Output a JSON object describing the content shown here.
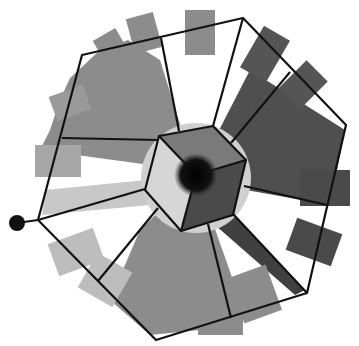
{
  "diagram": {
    "colors": {
      "background": "#ffffff",
      "edge": "#111111",
      "fan_light": "#bdbdbd",
      "fan_mid": "#8c8c8c",
      "fan_dark": "#555555",
      "fan_darker": "#3d3d3d",
      "cube_top": "#7a7a7a",
      "cube_left": "#d4d4d4",
      "cube_right": "#4a4a4a",
      "cube_front": "#6a6a6a",
      "center_dot": "#0a0a0a",
      "anchor_dot": "#111111"
    },
    "outer_polygon": [
      [
        82,
        55
      ],
      [
        243,
        18
      ],
      [
        346,
        125
      ],
      [
        307,
        293
      ],
      [
        156,
        340
      ],
      [
        38,
        220
      ]
    ],
    "cube": {
      "center": [
        196,
        175
      ],
      "vertices": [
        [
          159,
          136
        ],
        [
          213,
          126
        ],
        [
          246,
          160
        ],
        [
          233,
          215
        ],
        [
          181,
          231
        ],
        [
          145,
          190
        ]
      ],
      "inner_edges": [
        [
          [
            196,
            175
          ],
          [
            159,
            136
          ]
        ],
        [
          [
            196,
            175
          ],
          [
            246,
            160
          ]
        ],
        [
          [
            196,
            175
          ],
          [
            181,
            231
          ]
        ]
      ]
    },
    "spokes": [
      [
        [
          62,
          138
        ],
        [
          159,
          136
        ]
      ],
      [
        [
          161,
          38
        ],
        [
          179,
          130
        ]
      ],
      [
        [
          243,
          18
        ],
        [
          213,
          126
        ]
      ],
      [
        [
          290,
          72
        ],
        [
          231,
          142
        ]
      ],
      [
        [
          327,
          205
        ],
        [
          244,
          186
        ]
      ],
      [
        [
          307,
          293
        ],
        [
          233,
          214
        ]
      ],
      [
        [
          231,
          318
        ],
        [
          208,
          224
        ]
      ],
      [
        [
          98,
          281
        ],
        [
          158,
          210
        ]
      ],
      [
        [
          38,
          220
        ],
        [
          145,
          188
        ]
      ]
    ],
    "anchor_node": {
      "position": [
        17,
        223
      ],
      "radius": 8
    },
    "center_node": {
      "position": [
        196,
        175
      ],
      "radius": 19
    }
  }
}
